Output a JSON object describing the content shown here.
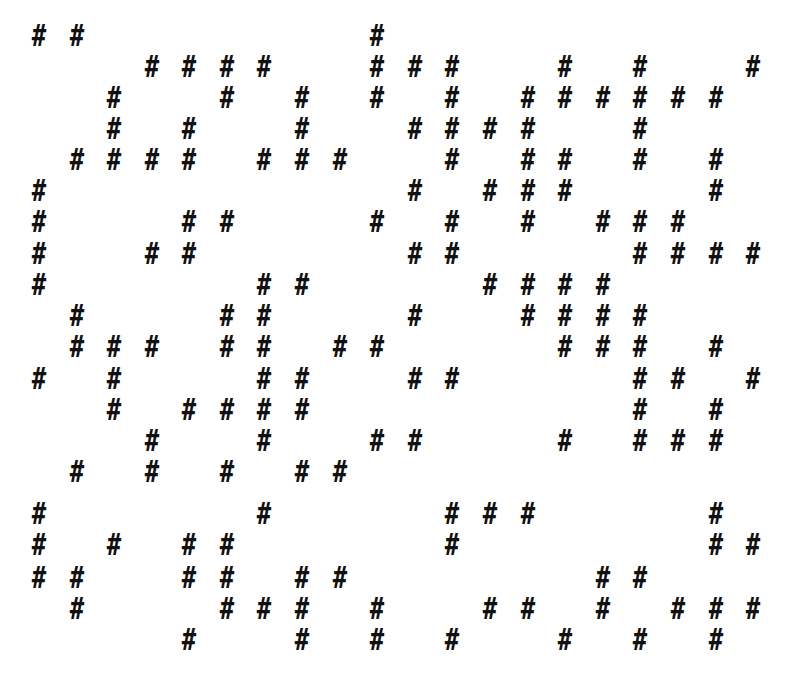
{
  "glyph": "#",
  "ink_color": "#111111",
  "background_color": "#ffffff",
  "columns_x": [
    39,
    77,
    114,
    152,
    189,
    227,
    264,
    302,
    340,
    377,
    415,
    452,
    490,
    528,
    565,
    603,
    640,
    678,
    716,
    753
  ],
  "rows": [
    {
      "y": 36,
      "cols": [
        0,
        1,
        9
      ]
    },
    {
      "y": 67,
      "cols": [
        3,
        4,
        5,
        6,
        9,
        10,
        11,
        14,
        16,
        19
      ]
    },
    {
      "y": 98,
      "cols": [
        2,
        5,
        7,
        9,
        11,
        13,
        14,
        15,
        16,
        17,
        18
      ]
    },
    {
      "y": 129,
      "cols": [
        2,
        4,
        7,
        10,
        11,
        12,
        13,
        16
      ]
    },
    {
      "y": 160,
      "cols": [
        1,
        2,
        3,
        4,
        6,
        7,
        8,
        11,
        13,
        14,
        16,
        18
      ]
    },
    {
      "y": 191,
      "cols": [
        0,
        10,
        12,
        13,
        14,
        18
      ]
    },
    {
      "y": 222,
      "cols": [
        0,
        4,
        5,
        9,
        11,
        13,
        15,
        16,
        17
      ]
    },
    {
      "y": 254,
      "cols": [
        0,
        3,
        4,
        10,
        11,
        16,
        17,
        18,
        19
      ]
    },
    {
      "y": 285,
      "cols": [
        0,
        6,
        7,
        12,
        13,
        14,
        15
      ]
    },
    {
      "y": 316,
      "cols": [
        1,
        5,
        6,
        10,
        13,
        14,
        15,
        16
      ]
    },
    {
      "y": 347,
      "cols": [
        1,
        2,
        3,
        5,
        6,
        8,
        9,
        14,
        15,
        16,
        18
      ]
    },
    {
      "y": 379,
      "cols": [
        0,
        2,
        6,
        7,
        10,
        11,
        16,
        17,
        19
      ]
    },
    {
      "y": 410,
      "cols": [
        2,
        4,
        5,
        6,
        7,
        16,
        18
      ]
    },
    {
      "y": 441,
      "cols": [
        3,
        6,
        9,
        10,
        14,
        16,
        17,
        18
      ]
    },
    {
      "y": 472,
      "cols": [
        1,
        3,
        5,
        7,
        8
      ]
    },
    {
      "y": 514,
      "cols": [
        0,
        6,
        11,
        12,
        13,
        18
      ]
    },
    {
      "y": 545,
      "cols": [
        0,
        2,
        4,
        5,
        11,
        18,
        19
      ]
    },
    {
      "y": 578,
      "cols": [
        0,
        1,
        4,
        5,
        7,
        8,
        15,
        16
      ]
    },
    {
      "y": 609,
      "cols": [
        1,
        5,
        6,
        7,
        9,
        12,
        13,
        15,
        17,
        18,
        19
      ]
    },
    {
      "y": 640,
      "cols": [
        4,
        7,
        9,
        11,
        14,
        16,
        18
      ]
    }
  ]
}
